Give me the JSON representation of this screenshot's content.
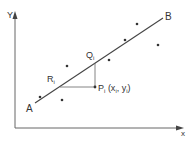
{
  "diagram": {
    "title": "",
    "axes": {
      "x_label": "x",
      "y_label": "Y"
    },
    "line": {
      "start_label": "A",
      "end_label": "B"
    },
    "points": {
      "P": {
        "name": "P",
        "sub": "i",
        "coord_open": "(x",
        "coord_sub_x": "i",
        "coord_sep": ", y",
        "coord_sub_y": "i",
        "coord_close": ")"
      },
      "Q": {
        "name": "Q",
        "sub": "i"
      },
      "R": {
        "name": "R",
        "sub": "i"
      }
    },
    "colors": {
      "stroke": "#555555",
      "text": "#333333",
      "background": "#ffffff"
    },
    "scatter_points": [
      [
        40,
        97
      ],
      [
        62,
        100
      ],
      [
        67,
        66
      ],
      [
        95,
        87
      ],
      [
        109,
        60
      ],
      [
        125,
        40
      ],
      [
        137,
        24
      ],
      [
        158,
        45
      ]
    ]
  }
}
